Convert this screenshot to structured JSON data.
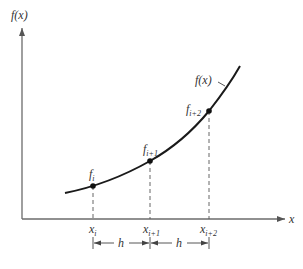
{
  "diagram": {
    "y_axis_label": "f(x)",
    "x_axis_label": "x",
    "curve_label": "f(x)",
    "points": [
      {
        "f_base": "f",
        "f_sub": "i",
        "x_base": "x",
        "x_sub": "i"
      },
      {
        "f_base": "f",
        "f_sub": "i+1",
        "x_base": "x",
        "x_sub": "i+1"
      },
      {
        "f_base": "f",
        "f_sub": "i+2",
        "x_base": "x",
        "x_sub": "i+2"
      }
    ],
    "spacing_labels": [
      "h",
      "h"
    ],
    "colors": {
      "axis": "#6b6b6b",
      "curve": "#1a1a1a",
      "text": "#333333",
      "background": "#ffffff"
    }
  }
}
